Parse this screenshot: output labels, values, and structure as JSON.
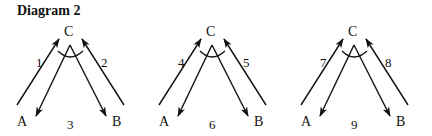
{
  "title": "Diagram 2",
  "colors": {
    "ink": "#111111",
    "background": "#ffffff"
  },
  "panels": [
    {
      "id": "panel-1",
      "offset_x": 0,
      "top_label": "C",
      "left_label": "A",
      "right_label": "B",
      "left_ray_label": "1",
      "right_ray_label": "2",
      "bottom_label": "3"
    },
    {
      "id": "panel-2",
      "offset_x": 142,
      "top_label": "C",
      "left_label": "A",
      "right_label": "B",
      "left_ray_label": "4",
      "right_ray_label": "5",
      "bottom_label": "6"
    },
    {
      "id": "panel-3",
      "offset_x": 284,
      "top_label": "C",
      "left_label": "A",
      "right_label": "B",
      "left_ray_label": "7",
      "right_ray_label": "8",
      "bottom_label": "9"
    }
  ]
}
